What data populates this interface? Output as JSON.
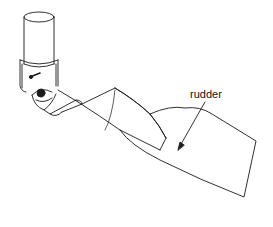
{
  "diagram": {
    "labels": {
      "rudder": "rudder"
    },
    "colors": {
      "line": "#1a1a1a",
      "background": "#ffffff"
    }
  }
}
